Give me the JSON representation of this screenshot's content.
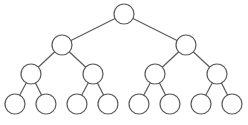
{
  "diagram": {
    "type": "binary-tree",
    "levels": 4,
    "colors": {
      "stroke": "#5a5a5a",
      "fill": "#ffffff",
      "background": "#ffffff"
    },
    "node_radius": 10,
    "nodes": [
      {
        "id": "n0",
        "level": 0,
        "x": 124,
        "y": 14
      },
      {
        "id": "n1",
        "level": 1,
        "x": 62,
        "y": 45
      },
      {
        "id": "n2",
        "level": 1,
        "x": 186,
        "y": 45
      },
      {
        "id": "n3",
        "level": 2,
        "x": 31,
        "y": 74
      },
      {
        "id": "n4",
        "level": 2,
        "x": 93,
        "y": 74
      },
      {
        "id": "n5",
        "level": 2,
        "x": 155,
        "y": 74
      },
      {
        "id": "n6",
        "level": 2,
        "x": 217,
        "y": 74
      },
      {
        "id": "n7",
        "level": 3,
        "x": 15,
        "y": 104
      },
      {
        "id": "n8",
        "level": 3,
        "x": 46,
        "y": 104
      },
      {
        "id": "n9",
        "level": 3,
        "x": 77,
        "y": 104
      },
      {
        "id": "n10",
        "level": 3,
        "x": 108,
        "y": 104
      },
      {
        "id": "n11",
        "level": 3,
        "x": 139,
        "y": 104
      },
      {
        "id": "n12",
        "level": 3,
        "x": 170,
        "y": 104
      },
      {
        "id": "n13",
        "level": 3,
        "x": 201,
        "y": 104
      },
      {
        "id": "n14",
        "level": 3,
        "x": 232,
        "y": 104
      }
    ],
    "edges": [
      [
        "n0",
        "n1"
      ],
      [
        "n0",
        "n2"
      ],
      [
        "n1",
        "n3"
      ],
      [
        "n1",
        "n4"
      ],
      [
        "n2",
        "n5"
      ],
      [
        "n2",
        "n6"
      ],
      [
        "n3",
        "n7"
      ],
      [
        "n3",
        "n8"
      ],
      [
        "n4",
        "n9"
      ],
      [
        "n4",
        "n10"
      ],
      [
        "n5",
        "n11"
      ],
      [
        "n5",
        "n12"
      ],
      [
        "n6",
        "n13"
      ],
      [
        "n6",
        "n14"
      ]
    ]
  }
}
